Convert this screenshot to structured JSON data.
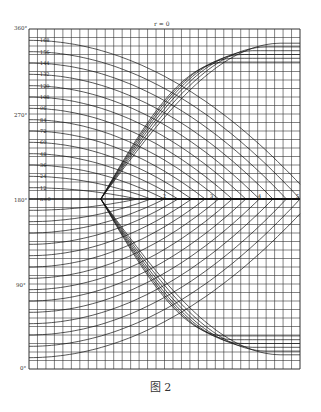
{
  "chart_data": {
    "type": "line",
    "title": "r = 0",
    "caption": "图 2",
    "xlabel": "",
    "ylabel": "",
    "grid": true,
    "y_ticks": [
      {
        "value": 0,
        "label": "0°"
      },
      {
        "value": 90,
        "label": "90°"
      },
      {
        "value": 180,
        "label": "180°"
      },
      {
        "value": 270,
        "label": "270°"
      },
      {
        "value": 360,
        "label": "360°"
      }
    ],
    "x_mid_ticks": [
      "2",
      "3",
      "4",
      "5"
    ],
    "ylim": [
      0,
      360
    ],
    "convergence_point": {
      "x_frac": 0.265,
      "y_deg": 180
    },
    "series_family_labels": [
      "168",
      "156",
      "144",
      "132",
      "120",
      "108",
      "96",
      "84",
      "72",
      "60",
      "48",
      "36",
      "24",
      "12",
      "n=0"
    ],
    "series": [
      {
        "name": "168",
        "start_deg": 348
      },
      {
        "name": "156",
        "start_deg": 336
      },
      {
        "name": "144",
        "start_deg": 324
      },
      {
        "name": "132",
        "start_deg": 312
      },
      {
        "name": "120",
        "start_deg": 300
      },
      {
        "name": "108",
        "start_deg": 288
      },
      {
        "name": "96",
        "start_deg": 276
      },
      {
        "name": "84",
        "start_deg": 264
      },
      {
        "name": "72",
        "start_deg": 252
      },
      {
        "name": "60",
        "start_deg": 240
      },
      {
        "name": "48",
        "start_deg": 228
      },
      {
        "name": "36",
        "start_deg": 216
      },
      {
        "name": "24",
        "start_deg": 204
      },
      {
        "name": "12",
        "start_deg": 192
      },
      {
        "name": "n=0",
        "start_deg": 180
      }
    ]
  }
}
